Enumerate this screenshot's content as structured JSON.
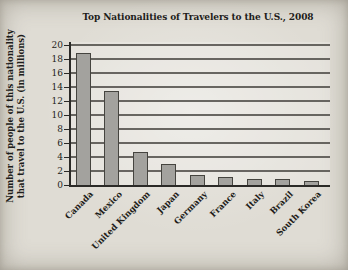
{
  "page": {
    "background": "#dfdcd4"
  },
  "chart_data": {
    "type": "bar",
    "title": "Top Nationalities of Travelers to the U.S., 2008",
    "ylabel_lines": [
      "Number of people of this nationality",
      "that travel to the U.S. (in millions)"
    ],
    "categories": [
      "Canada",
      "Mexico",
      "United Kingdom",
      "Japan",
      "Germany",
      "France",
      "Italy",
      "Brazil",
      "South Korea"
    ],
    "values": [
      18.8,
      13.4,
      4.7,
      3.0,
      1.5,
      1.1,
      0.8,
      0.8,
      0.6
    ],
    "ylim": [
      0,
      20
    ],
    "ytick_step": 2,
    "ytick_labels": [
      "0",
      "2",
      "4",
      "6",
      "8",
      "10",
      "12",
      "14",
      "16",
      "18",
      "20"
    ],
    "grid": true,
    "legend": "none",
    "bar_color": "#a3a29e",
    "bar_border_color": "#45443f",
    "grid_color": "#55534e",
    "axis_color": "#2b2a27",
    "text_color": "#1e1d1a"
  }
}
